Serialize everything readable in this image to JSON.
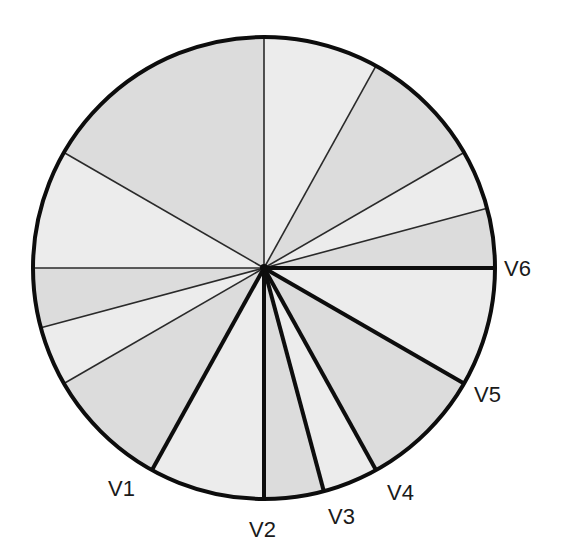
{
  "diagram": {
    "type": "pie-sector-diagram",
    "center": [
      264,
      268
    ],
    "radius": 231,
    "colors": {
      "background": "#ffffff",
      "fill_light": "#ececec",
      "fill_dark": "#dcdcdc",
      "outline": "#0d0d0d",
      "thin_line": "#2a2a2a",
      "label": "#1a1a1a"
    },
    "spokes": [
      {
        "angle": 90,
        "thick": false
      },
      {
        "angle": 61,
        "thick": false
      },
      {
        "angle": 30,
        "thick": false
      },
      {
        "angle": 15,
        "thick": false
      },
      {
        "angle": 0,
        "thick": true,
        "label": "V6"
      },
      {
        "angle": -30,
        "thick": true,
        "label": "V5"
      },
      {
        "angle": -61,
        "thick": true,
        "label": "V4"
      },
      {
        "angle": -75,
        "thick": true,
        "label": "V3"
      },
      {
        "angle": -90,
        "thick": true,
        "label": "V2"
      },
      {
        "angle": -119,
        "thick": true,
        "label": "V1"
      },
      {
        "angle": -150,
        "thick": false
      },
      {
        "angle": -165,
        "thick": false
      },
      {
        "angle": -180,
        "thick": false
      },
      {
        "angle": -210,
        "thick": false
      }
    ],
    "sectors": [
      {
        "from": 90,
        "to": 61,
        "shade": "light"
      },
      {
        "from": 61,
        "to": 30,
        "shade": "dark"
      },
      {
        "from": 30,
        "to": 15,
        "shade": "light"
      },
      {
        "from": 15,
        "to": 0,
        "shade": "dark"
      },
      {
        "from": 0,
        "to": -30,
        "shade": "light"
      },
      {
        "from": -30,
        "to": -61,
        "shade": "dark"
      },
      {
        "from": -61,
        "to": -75,
        "shade": "light"
      },
      {
        "from": -75,
        "to": -90,
        "shade": "dark"
      },
      {
        "from": -90,
        "to": -119,
        "shade": "light"
      },
      {
        "from": -119,
        "to": -150,
        "shade": "dark"
      },
      {
        "from": -150,
        "to": -165,
        "shade": "light"
      },
      {
        "from": -165,
        "to": -180,
        "shade": "dark"
      },
      {
        "from": -180,
        "to": -210,
        "shade": "light"
      },
      {
        "from": -210,
        "to": -270,
        "shade": "dark"
      }
    ],
    "labels": [
      {
        "text": "V1",
        "x": 108,
        "y": 478
      },
      {
        "text": "V2",
        "x": 249,
        "y": 519
      },
      {
        "text": "V3",
        "x": 328,
        "y": 506
      },
      {
        "text": "V4",
        "x": 387,
        "y": 482
      },
      {
        "text": "V5",
        "x": 474,
        "y": 384
      },
      {
        "text": "V6",
        "x": 504,
        "y": 258
      }
    ]
  }
}
